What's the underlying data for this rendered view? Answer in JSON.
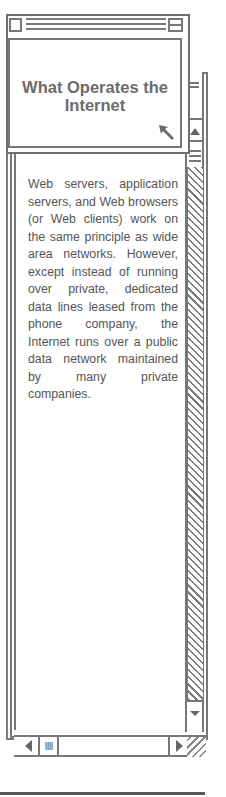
{
  "window": {
    "title": "What Operates the Internet",
    "close_box_label": "close box",
    "zoom_box_label": "zoom box"
  },
  "content": {
    "body": "Web servers, application servers, and Web browsers (or Web clients) work on the same principle as wide area networks. However, except instead of running over private, dedicated data lines leased from the phone company, the Internet runs over a public data network maintained by many private companies."
  },
  "scrollbars": {
    "vertical": {
      "up_arrow": "▲",
      "down_arrow": "▼"
    },
    "horizontal": {
      "left_arrow": "◀",
      "right_arrow": "▶",
      "grip": "IIII"
    }
  },
  "colors": {
    "line": "#777777",
    "text": "#555555",
    "title_text": "#6c6c6c",
    "background": "#ffffff"
  }
}
